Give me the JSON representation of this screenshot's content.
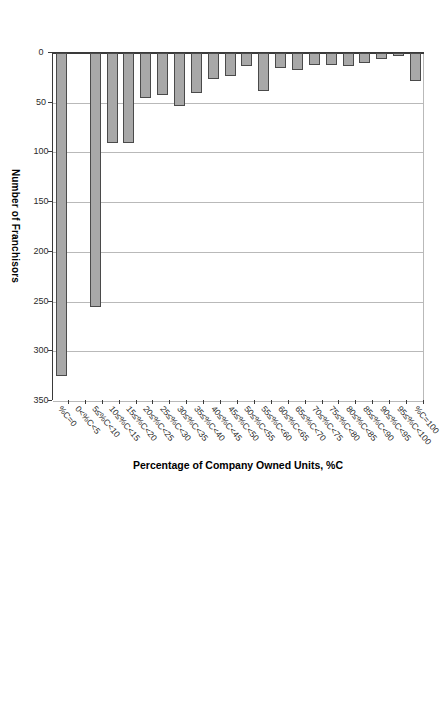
{
  "chart_data": {
    "type": "bar",
    "orientation": "horizontal",
    "title": "",
    "xlabel": "Number of Franchisors",
    "ylabel": "Percentage of Company Owned Units, %C",
    "xlim": [
      0,
      350
    ],
    "xticks": [
      0,
      50,
      100,
      150,
      200,
      250,
      300,
      350
    ],
    "grid": true,
    "legend": "none",
    "bar_color": "#a8a8a8",
    "bar_border_color": "#4a4a4a",
    "categories": [
      "%C=0",
      "0<%C<5",
      "5≤%C<10",
      "10≤%C<15",
      "15≤%C<20",
      "20≤%C<25",
      "25≤%C<30",
      "30≤%C<35",
      "35≤%C<40",
      "40≤%C<45",
      "45≤%C<50",
      "50≤%C<55",
      "55≤%C<60",
      "60≤%C<65",
      "65≤%C<70",
      "70≤%C<75",
      "75≤%C<80",
      "80≤%C<85",
      "85≤%C<90",
      "90≤%C<95",
      "95≤%C<100",
      "%C=100"
    ],
    "values": [
      325,
      0,
      255,
      91,
      91,
      45,
      42,
      53,
      40,
      26,
      23,
      13,
      38,
      15,
      17,
      12,
      12,
      13,
      10,
      6,
      3,
      28
    ]
  }
}
